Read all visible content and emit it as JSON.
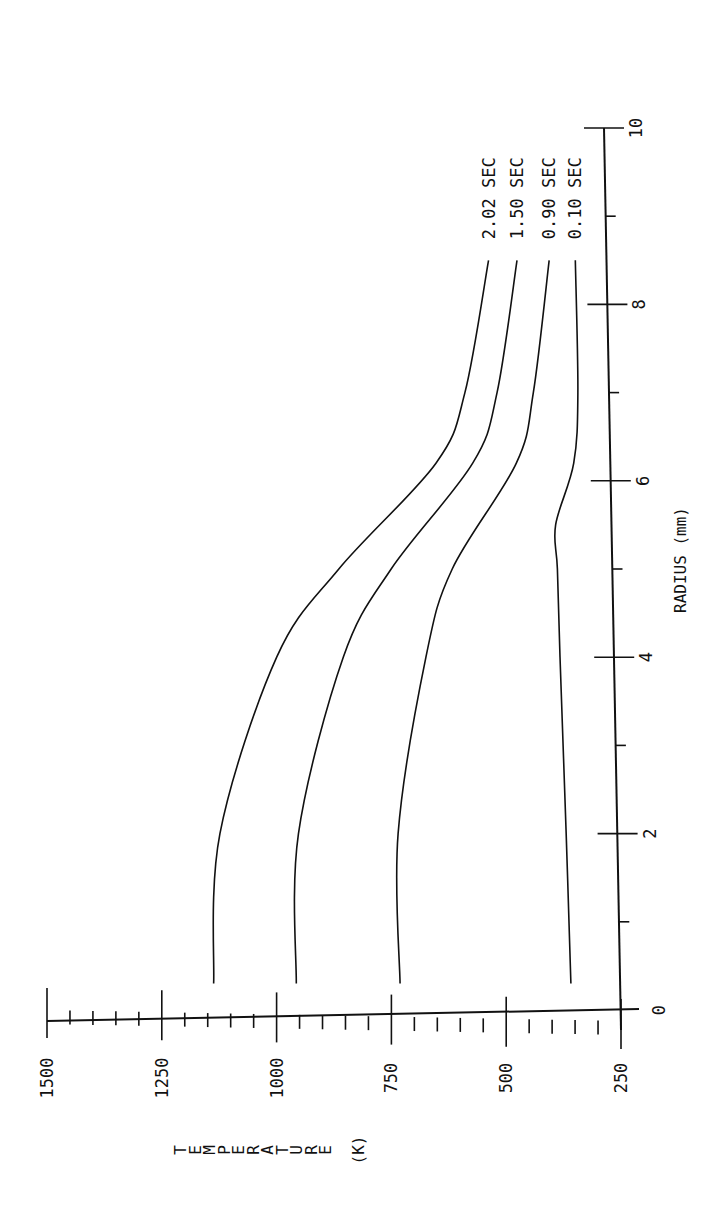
{
  "chart_data": {
    "type": "line",
    "title": "",
    "xlabel": "RADIUS (mm)",
    "ylabel": "TEMPERATURE (K)",
    "xlim": [
      0,
      10
    ],
    "ylim": [
      250,
      1500
    ],
    "x_ticks_major": [
      0,
      2,
      4,
      6,
      8,
      10
    ],
    "x_tick_labels": [
      "0",
      "2",
      "4",
      "6",
      "8",
      "10"
    ],
    "x_ticks_minor": [
      1,
      3,
      5,
      7,
      9
    ],
    "y_ticks_major": [
      250,
      500,
      750,
      1000,
      1250,
      1500
    ],
    "y_tick_labels": [
      "250",
      "500",
      "750",
      "1000",
      "1250",
      "1500"
    ],
    "y_ticks_minor_step": 50,
    "grid": false,
    "orientation": "rotated-90",
    "series": [
      {
        "name": "2.02 SEC",
        "x": [
          0.3,
          2,
          4,
          5,
          6.2,
          7,
          8.5
        ],
        "values": [
          1136,
          1116,
          985,
          846,
          630,
          564,
          507
        ]
      },
      {
        "name": "1.50 SEC",
        "x": [
          0.3,
          2,
          4,
          5,
          6.2,
          7,
          8.5
        ],
        "values": [
          956,
          945,
          840,
          732,
          550,
          494,
          445
        ]
      },
      {
        "name": "0.90 SEC",
        "x": [
          0.3,
          2,
          4,
          5,
          6.2,
          7,
          8.5
        ],
        "values": [
          730,
          728,
          660,
          599,
          455,
          415,
          375
        ]
      },
      {
        "name": "0.10 SEC",
        "x": [
          0.3,
          2,
          4,
          5,
          5.5,
          6.2,
          7,
          8.5
        ],
        "values": [
          358,
          362,
          368,
          370,
          372,
          330,
          318,
          318
        ]
      }
    ]
  }
}
